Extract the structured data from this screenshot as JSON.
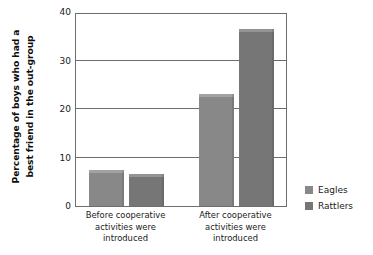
{
  "chart_data": {
    "type": "bar",
    "title": "",
    "xlabel": "",
    "ylabel_line1": "Percentage of boys who had a",
    "ylabel_line2": "best friend in the out-group",
    "categories": [
      "Before cooperative activities were introduced",
      "After cooperative activities were introduced"
    ],
    "category_lines": [
      [
        "Before cooperative",
        "activities were",
        "introduced"
      ],
      [
        "After cooperative",
        "activities were",
        "introduced"
      ]
    ],
    "series": [
      {
        "name": "Eagles",
        "color": "#888888",
        "values": [
          7.5,
          23.1
        ]
      },
      {
        "name": "Rattlers",
        "color": "#767676",
        "values": [
          6.6,
          36.6
        ]
      }
    ],
    "ylim": [
      0,
      40
    ],
    "yticks": [
      0,
      10,
      20,
      30,
      40
    ],
    "ytick_labels": [
      "0",
      "10",
      "20",
      "30",
      "40"
    ],
    "gridlines": [
      10,
      20,
      30
    ],
    "grid": true,
    "legend_position": "right",
    "axis_color": "#6e6e6e",
    "text_color": "#1a1a1a",
    "background": "#ffffff"
  },
  "legend": {
    "items": [
      {
        "label": "Eagles",
        "color": "#888888"
      },
      {
        "label": "Rattlers",
        "color": "#767676"
      }
    ]
  }
}
